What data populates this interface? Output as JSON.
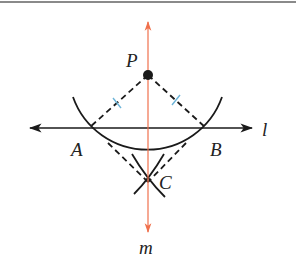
{
  "diagram": {
    "colors": {
      "perpendicular_line": "#f0704c",
      "construction": "#1a1a1a",
      "tick_marks": "#6cb4d8",
      "top_rule": "#8a8a8a"
    },
    "points": {
      "P": {
        "label": "P",
        "x": 148,
        "y": 75
      },
      "A": {
        "label": "A",
        "x": 89,
        "y": 128
      },
      "B": {
        "label": "B",
        "x": 206,
        "y": 128
      },
      "C": {
        "label": "C",
        "x": 148,
        "y": 182
      }
    },
    "lines": {
      "l": {
        "label": "l",
        "type": "horizontal",
        "y": 128
      },
      "m": {
        "label": "m",
        "type": "vertical",
        "x": 148
      }
    },
    "labels": {
      "P": "P",
      "A": "A",
      "B": "B",
      "C": "C",
      "l": "l",
      "m": "m"
    }
  }
}
